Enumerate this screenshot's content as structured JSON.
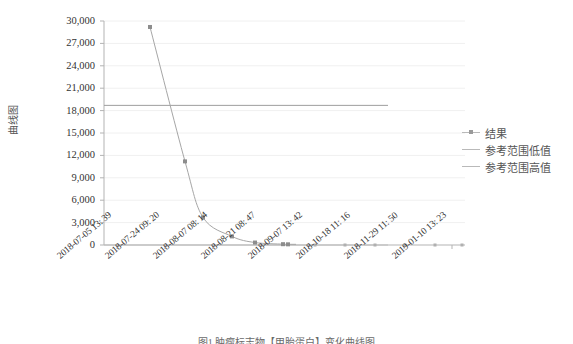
{
  "chart_data": {
    "type": "line",
    "title": "",
    "ylabel": "曲线图",
    "xlabel": "",
    "ylim": [
      0,
      30000
    ],
    "yticks": [
      0,
      3000,
      6000,
      9000,
      12000,
      15000,
      18000,
      21000,
      24000,
      27000,
      30000
    ],
    "ytick_labels": [
      "0",
      "3,000",
      "6,000",
      "9,000",
      "12,000",
      "15,000",
      "18,000",
      "21,000",
      "24,000",
      "27,000",
      "30,000"
    ],
    "grid": true,
    "legend_position": "right",
    "xtick_labels": [
      "2018-07-05 13: 39",
      "2018-07-24 09: 20",
      "2018-08-07 08: 14",
      "2018-08-21 08: 47",
      "2018-09-07 13: 42",
      "2018-10-18 11: 16",
      "2018-11-29 11: 50",
      "2019-01-10 13: 23"
    ],
    "series": [
      {
        "name": "结果",
        "kind": "line+markers",
        "color": "#a6a6a6",
        "points": [
          {
            "x": "2018-07-13",
            "value": 29200
          },
          {
            "x": "2018-07-29",
            "value": 11200
          },
          {
            "x": "2018-08-12",
            "value": 3700
          },
          {
            "x": "2018-08-26",
            "value": 1150
          },
          {
            "x": "2018-09-07",
            "value": 330
          },
          {
            "x": "2018-09-20",
            "value": 110
          },
          {
            "x": "2018-09-26",
            "value": 90
          }
        ]
      },
      {
        "name": "参考范围低值",
        "kind": "line",
        "color": "#bdbdbd",
        "constant": 0
      },
      {
        "name": "参考范围高值",
        "kind": "line",
        "color": "#9d9d9d",
        "constant": 18700
      }
    ]
  },
  "axis": {
    "y_title": "曲线图"
  },
  "legend": {
    "items": [
      {
        "label": "结果",
        "icon": "line-marker-icon"
      },
      {
        "label": "参考范围低值",
        "icon": "line-icon"
      },
      {
        "label": "参考范围高值",
        "icon": "line-icon"
      }
    ]
  },
  "caption": {
    "text": "图1  肿瘤标志物【甲胎蛋白】变化曲线图"
  }
}
